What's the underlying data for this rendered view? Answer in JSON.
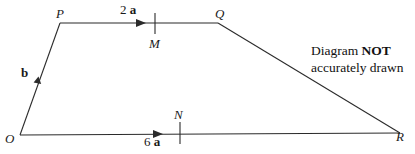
{
  "figure": {
    "kind": "vector-geometry-trapezium",
    "background_color": "#ffffff",
    "stroke_color": "#2b2b2b",
    "text_color": "#1a1a1a",
    "vertices": [
      {
        "name": "O",
        "label": "O",
        "x": 20,
        "y": 135
      },
      {
        "name": "P",
        "label": "P",
        "x": 60,
        "y": 23
      },
      {
        "name": "Q",
        "label": "Q",
        "x": 218,
        "y": 23
      },
      {
        "name": "R",
        "label": "R",
        "x": 400,
        "y": 133
      }
    ],
    "edges": [
      {
        "name": "OP",
        "from": "O",
        "to": "P",
        "arrow": true,
        "arrow_t": 0.55
      },
      {
        "name": "PQ",
        "from": "P",
        "to": "Q",
        "arrow": true,
        "arrow_t": 0.53
      },
      {
        "name": "QR",
        "from": "Q",
        "to": "R",
        "arrow": false
      },
      {
        "name": "OR",
        "from": "O",
        "to": "R",
        "arrow": true,
        "arrow_t": 0.37
      }
    ],
    "midpoint_ticks": [
      {
        "name": "M",
        "label": "M",
        "on_edge": "PQ",
        "x": 155,
        "y": 23,
        "label_x": 149,
        "label_y": 37
      },
      {
        "name": "N",
        "label": "N",
        "on_edge": "OR",
        "x": 180,
        "y": 133,
        "label_x": 174,
        "label_y": 108
      }
    ],
    "vector_labels": [
      {
        "name": "PQ-vector",
        "scalar": "2",
        "vector": "a",
        "x": 120,
        "y": 3
      },
      {
        "name": "OR-vector",
        "scalar": "6",
        "vector": "a",
        "x": 144,
        "y": 135
      },
      {
        "name": "OP-vector",
        "scalar": "",
        "vector": "b",
        "x": 21,
        "y": 66
      }
    ]
  },
  "note": {
    "line1_prefix": "Diagram ",
    "line1_strong": "NOT",
    "line2": "accurately drawn"
  }
}
